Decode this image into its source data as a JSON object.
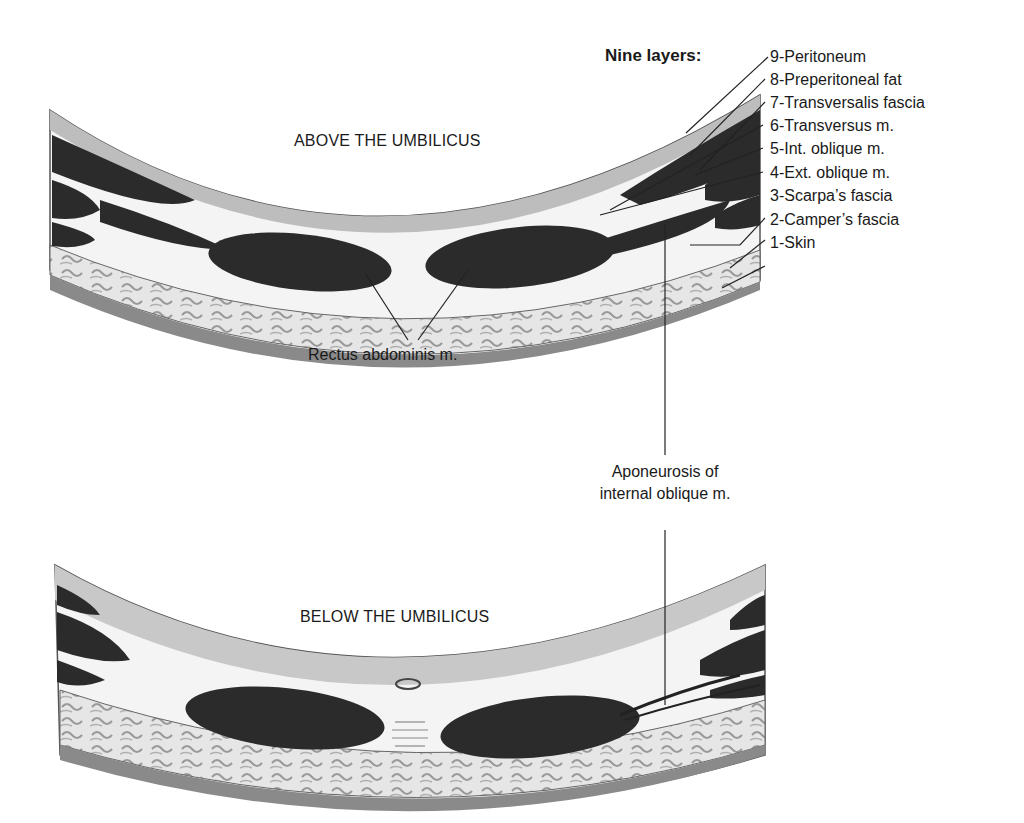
{
  "diagram": {
    "title": "Nine layers:",
    "layers": [
      {
        "num": 9,
        "label": "9-Peritoneum"
      },
      {
        "num": 8,
        "label": "8-Preperitoneal fat"
      },
      {
        "num": 7,
        "label": "7-Transversalis fascia"
      },
      {
        "num": 6,
        "label": "6-Transversus m."
      },
      {
        "num": 5,
        "label": "5-Int. oblique m."
      },
      {
        "num": 4,
        "label": "4-Ext. oblique m."
      },
      {
        "num": 3,
        "label": "3-Scarpa’s fascia"
      },
      {
        "num": 2,
        "label": "2-Camper’s fascia"
      },
      {
        "num": 1,
        "label": "1-Skin"
      }
    ],
    "sections": {
      "above": "ABOVE THE UMBILICUS",
      "below": "BELOW THE UMBILICUS"
    },
    "annotations": {
      "rectus": "Rectus abdominis m.",
      "aponeurosis_line1": "Aponeurosis of",
      "aponeurosis_line2": "internal oblique m."
    },
    "colors": {
      "muscle": "#2b2b2b",
      "fascia": "#f2f2f2",
      "fat": "#d9d9d9",
      "skin": "#8c8c8c",
      "outline": "#333333"
    }
  }
}
